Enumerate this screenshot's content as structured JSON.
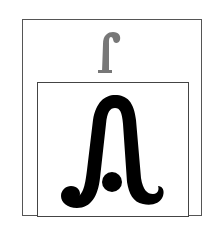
{
  "figure": {
    "outer_box": {
      "border_color": "#555555"
    },
    "inner_box": {
      "border_color": "#444444"
    },
    "small_glyph": {
      "name": "hooked-f-glyph",
      "color": "#777777"
    },
    "large_glyph": {
      "name": "arch-with-dot-glyph",
      "color": "#000000"
    }
  }
}
